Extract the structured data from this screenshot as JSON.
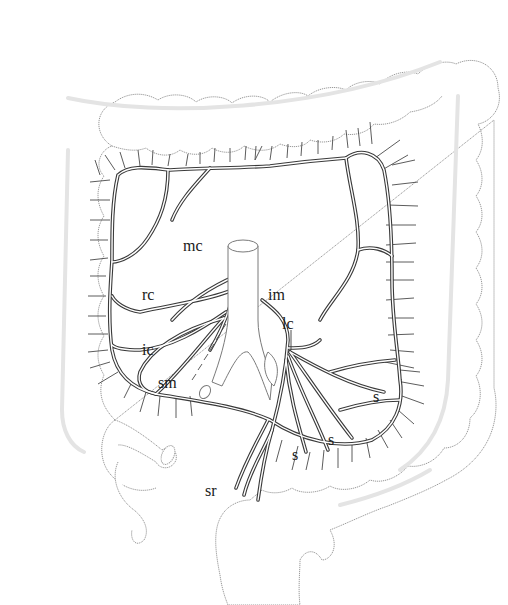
{
  "figure": {
    "style": "line drawing, black on white",
    "colors": {
      "vessel": "#3a3a3a",
      "colon_outline": "#9a9a9a",
      "taenia": "#e4e4e4",
      "background": "#ffffff"
    }
  },
  "labels": {
    "mc": "mc",
    "rc": "rc",
    "ic": "ic",
    "sm": "sm",
    "im": "im",
    "lc": "lc",
    "s1": "s",
    "s2": "s",
    "s3": "s",
    "sr": "sr"
  },
  "label_positions": {
    "mc": [
      183,
      238
    ],
    "rc": [
      142,
      287
    ],
    "ic": [
      142,
      342
    ],
    "sm": [
      158,
      375
    ],
    "im": [
      268,
      287
    ],
    "lc": [
      282,
      316
    ],
    "s1": [
      373,
      389
    ],
    "s2": [
      328,
      432
    ],
    "s3": [
      292,
      447
    ],
    "sr": [
      205,
      483
    ]
  }
}
